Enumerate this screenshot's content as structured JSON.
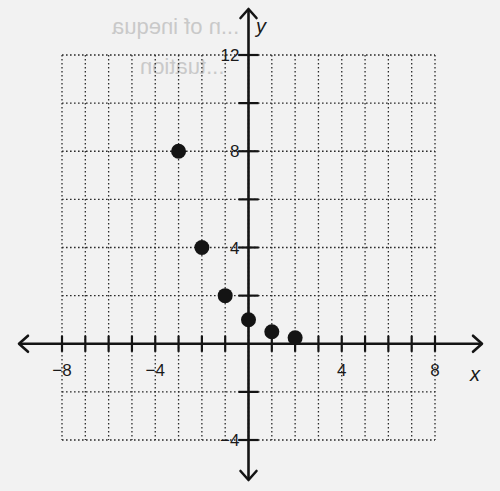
{
  "background_bleed_text": {
    "line1": "...n of inequa",
    "line2": "...tuation"
  },
  "colors": {
    "background": "#f2f2f2",
    "ink": "#141414",
    "grid": "#2a2a2a",
    "bleed": "#c9c9c9"
  },
  "chart_data": {
    "type": "scatter",
    "title": "",
    "xlabel": "x",
    "ylabel": "y",
    "xlim": [
      -8,
      8
    ],
    "ylim": [
      -4,
      12
    ],
    "x_grid_step": 1,
    "y_grid_step": 2,
    "grid": true,
    "grid_style": "dotted",
    "x_tick_labels": [
      {
        "value": -8,
        "label": "−8"
      },
      {
        "value": -4,
        "label": "−4"
      },
      {
        "value": 4,
        "label": "4"
      },
      {
        "value": 8,
        "label": "8"
      }
    ],
    "y_tick_labels": [
      {
        "value": 12,
        "label": "12"
      },
      {
        "value": 8,
        "label": "8"
      },
      {
        "value": 4,
        "label": "4"
      },
      {
        "value": -4,
        "label": "−4"
      }
    ],
    "series": [
      {
        "name": "points",
        "marker": "filled-circle",
        "points": [
          {
            "x": -3,
            "y": 8
          },
          {
            "x": -2,
            "y": 4
          },
          {
            "x": -1,
            "y": 2
          },
          {
            "x": 0,
            "y": 1
          },
          {
            "x": 1,
            "y": 0.5
          },
          {
            "x": 2,
            "y": 0.25
          }
        ]
      }
    ],
    "legend": null
  }
}
